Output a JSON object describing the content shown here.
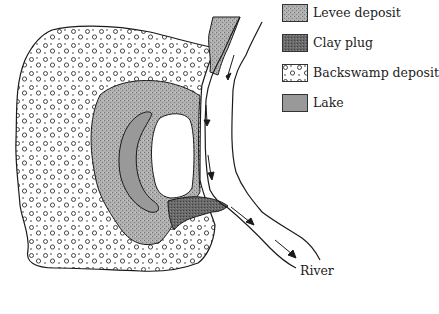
{
  "legend": {
    "items": [
      {
        "label": "Levee deposit",
        "pattern": "levee-stipple",
        "color": "#a8a8a8"
      },
      {
        "label": "Clay plug",
        "pattern": "clay-dense",
        "color": "#6e6e6e"
      },
      {
        "label": "Backswamp deposit",
        "pattern": "backswamp-circles",
        "color": "#ffffff"
      },
      {
        "label": "Lake",
        "pattern": "solid",
        "color": "#9a9a9a"
      }
    ]
  },
  "labels": {
    "river": "River"
  },
  "colors": {
    "outline": "#1a1a1a",
    "levee": "#a8a8a8",
    "clay": "#6a6a6a",
    "lake": "#999999",
    "background": "#ffffff"
  }
}
